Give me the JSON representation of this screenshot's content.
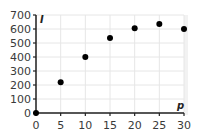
{
  "chart_data": {
    "type": "scatter",
    "title": "",
    "xlabel": "p",
    "ylabel": "I",
    "x": [
      0,
      5,
      10,
      15,
      20,
      25,
      30
    ],
    "y": [
      0,
      220,
      400,
      535,
      605,
      635,
      600
    ],
    "x_ticks": [
      "0",
      "5",
      "10",
      "15",
      "20",
      "25",
      "30"
    ],
    "y_ticks": [
      "0",
      "100",
      "200",
      "300",
      "400",
      "500",
      "600",
      "700"
    ],
    "xlim": [
      0,
      30
    ],
    "ylim": [
      0,
      700
    ],
    "grid": true,
    "legend": null,
    "marker_color": "#000000",
    "grid_color": "#e6e6e6"
  }
}
